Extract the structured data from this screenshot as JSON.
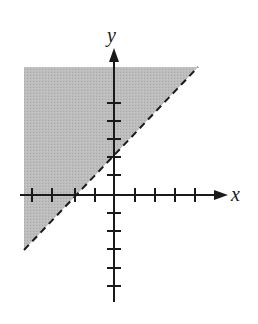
{
  "graph": {
    "type": "linear-inequality",
    "inequality": "y > x + 2",
    "boundary": {
      "equation": "y = x + 2",
      "style": "dashed",
      "slope": 1,
      "y_intercept": 2,
      "x_intercept": -2
    },
    "shaded_region": "above-left of boundary line",
    "axes": {
      "x_label": "x",
      "y_label": "y",
      "x_ticks": [
        -4,
        -3,
        -2,
        -1,
        1,
        2,
        3,
        4
      ],
      "y_ticks": [
        -5,
        -4,
        -3,
        -2,
        -1,
        1,
        2,
        3,
        4
      ],
      "x_range": [
        -4.5,
        5.5
      ],
      "y_range": [
        -5.5,
        6.5
      ]
    },
    "colors": {
      "shade": "#b8b8b8",
      "axis": "#1a1a1a",
      "boundary": "#1a1a1a",
      "background": "#ffffff"
    }
  }
}
